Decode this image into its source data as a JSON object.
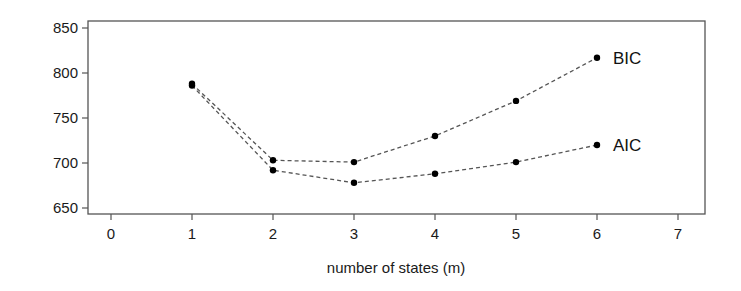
{
  "chart_data": {
    "type": "line",
    "title": "",
    "xlabel": "number of states (m)",
    "ylabel": "",
    "xlim": [
      0,
      7
    ],
    "ylim": [
      650,
      850
    ],
    "x_ticks": [
      0,
      1,
      2,
      3,
      4,
      5,
      6,
      7
    ],
    "y_ticks": [
      650,
      700,
      750,
      800,
      850
    ],
    "x": [
      1,
      2,
      3,
      4,
      5,
      6
    ],
    "series": [
      {
        "name": "BIC",
        "values": [
          788,
          703,
          701,
          730,
          769,
          817
        ],
        "line_style": "dashed",
        "marker": "filled-circle",
        "color": "#000000"
      },
      {
        "name": "AIC",
        "values": [
          786,
          692,
          678,
          688,
          701,
          720
        ],
        "line_style": "dashed",
        "marker": "filled-circle",
        "color": "#000000"
      }
    ],
    "grid": false,
    "legend": "direct labels at right end of each line"
  },
  "colors": {
    "axis": "#555555",
    "line": "#555555",
    "marker": "#000000",
    "text": "#1a1a1a"
  }
}
